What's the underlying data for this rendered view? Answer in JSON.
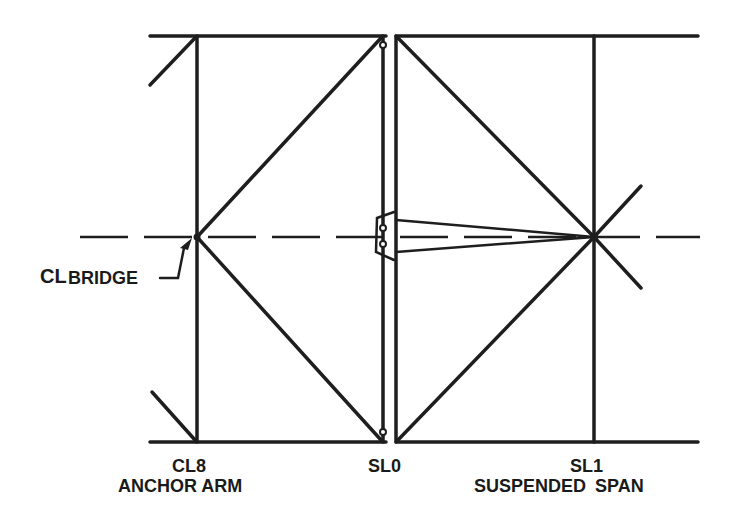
{
  "diagram": {
    "type": "bridge truss elevation",
    "line_color": "#1e1e1e",
    "labels": {
      "centerline": "BRIDGE",
      "centerline_symbol": "CL",
      "node_left": "CL8",
      "node_left_caption": "ANCHOR ARM",
      "node_middle": "SL0",
      "node_right": "SL1",
      "node_right_caption": "SUSPENDED SPAN"
    }
  }
}
